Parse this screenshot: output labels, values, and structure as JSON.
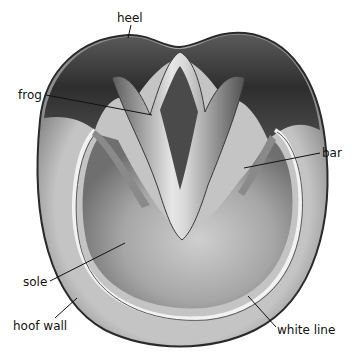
{
  "diagram": {
    "labels": [
      {
        "id": "heel",
        "text": "heel",
        "x": 117,
        "y": 12,
        "line": [
          131,
          25,
          128,
          38
        ]
      },
      {
        "id": "frog",
        "text": "frog",
        "x": 18,
        "y": 89,
        "line": [
          46,
          95,
          152,
          115
        ]
      },
      {
        "id": "bar",
        "text": "bar",
        "x": 322,
        "y": 147,
        "line": [
          320,
          153,
          244,
          168
        ]
      },
      {
        "id": "sole",
        "text": "sole",
        "x": 23,
        "y": 276,
        "line": [
          50,
          281,
          125,
          243
        ]
      },
      {
        "id": "hoof-wall",
        "text": "hoof wall",
        "x": 13,
        "y": 320,
        "line": [
          55,
          318,
          77,
          298
        ]
      },
      {
        "id": "white-line",
        "text": "white line",
        "x": 277,
        "y": 324,
        "line": [
          276,
          327,
          248,
          296
        ]
      }
    ]
  },
  "colors": {
    "background": "#ffffff",
    "wall_outer": "#3a3a3a",
    "wall": "#b8b8b8",
    "white_line": "#f2f2f2",
    "sole": "#9a9a9a",
    "sole_light": "#c9c9c9",
    "frog": "#6e6e6e",
    "heel_dark": "#2b2b2b",
    "label_text": "#111111",
    "leader_line": "#111111"
  }
}
